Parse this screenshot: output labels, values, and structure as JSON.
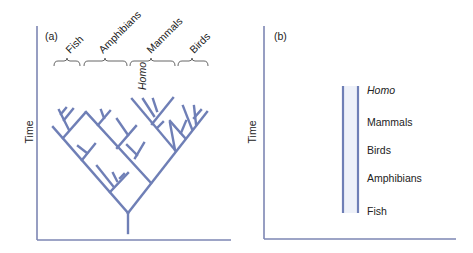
{
  "panel_a": {
    "label": "(a)",
    "y_axis_label": "Time",
    "groups": [
      {
        "name": "Fish"
      },
      {
        "name": "Amphibians"
      },
      {
        "name": "Mammals"
      },
      {
        "name": "Birds"
      }
    ],
    "highlight_taxon": "Homo",
    "description": "Branching tree of life: Fish, Amphibians, Mammals, Birds diverge from a common root"
  },
  "panel_b": {
    "label": "(b)",
    "y_axis_label": "Time",
    "ladder_levels": [
      {
        "name": "Homo",
        "italic": true
      },
      {
        "name": "Mammals",
        "italic": false
      },
      {
        "name": "Birds",
        "italic": false
      },
      {
        "name": "Amphibians",
        "italic": false
      },
      {
        "name": "Fish",
        "italic": false
      }
    ],
    "description": "Linear 'ladder' view of progress from Fish to Homo"
  },
  "colors": {
    "branch": "#6f7fb6",
    "axis": "#7d86b3",
    "text": "#222222",
    "ladder_fill": "#eef1f9"
  }
}
